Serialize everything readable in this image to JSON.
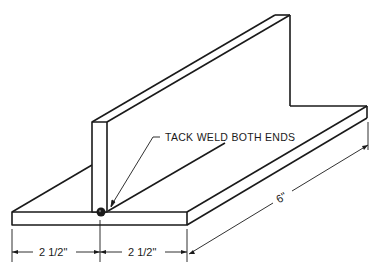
{
  "figure": {
    "type": "isometric technical drawing",
    "line_color": "#1a1a1a",
    "background": "#ffffff"
  },
  "annotations": {
    "tack_weld": "TACK WELD BOTH ENDS",
    "dim_left": "2 1/2\"",
    "dim_right": "2 1/2\"",
    "dim_length": "6\""
  }
}
